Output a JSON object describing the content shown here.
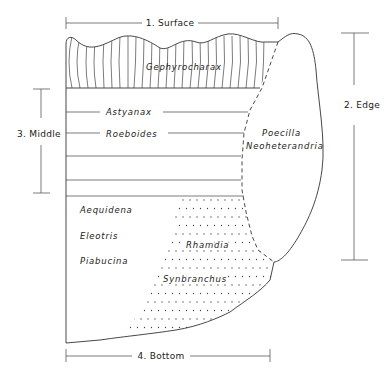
{
  "figure": {
    "type": "habitat zonation diagram",
    "zones": [
      {
        "id": "surface",
        "label": "1. Surface"
      },
      {
        "id": "edge",
        "label": "2. Edge"
      },
      {
        "id": "middle",
        "label": "3. Middle"
      },
      {
        "id": "bottom",
        "label": "4. Bottom"
      }
    ],
    "species": {
      "surface": [
        "Gephyrocharax"
      ],
      "middle": [
        "Astyanax",
        "Roeboides"
      ],
      "edge": [
        "Poecilla",
        "Neoheterandria"
      ],
      "bottom_open": [
        "Aequidena",
        "Eleotris",
        "Piabucina"
      ],
      "bottom_stippled": [
        "Rhamdia",
        "Synbranchus"
      ]
    }
  },
  "labels": {
    "surface": "1. Surface",
    "edge": "2. Edge",
    "middle": "3. Middle",
    "bottom": "4. Bottom",
    "gephyrocharax": "Gephyrocharax",
    "astyanax": "Astyanax",
    "roeboides": "Roeboides",
    "poecilla": "Poecilla",
    "neoheterandria": "Neoheterandria",
    "aequidena": "Aequidena",
    "eleotris": "Eleotris",
    "piabucina": "Piabucina",
    "rhamdia": "Rhamdia",
    "synbranchus": "Synbranchus"
  },
  "colors": {
    "line": "#333333",
    "text": "#222222",
    "background": "#ffffff"
  }
}
